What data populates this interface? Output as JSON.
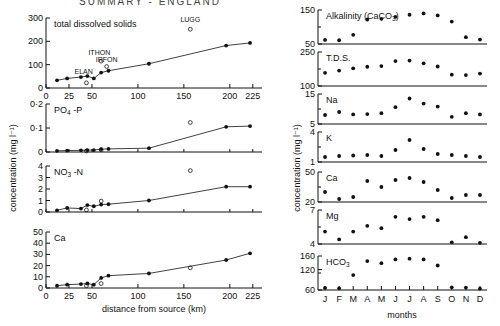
{
  "figure": {
    "title": "SUMMARY  -  ENGLAND",
    "left_axis_label": "concentration (mg l⁻¹)",
    "right_axis_label": "concentration (mg l⁻¹)",
    "left_xlabel": "distance from source (km)",
    "right_xlabel": "months"
  },
  "chart_data": [
    {
      "type": "scatter",
      "title": "total dissolved solids",
      "panel": "left-1",
      "xlabel": "distance from source (km)",
      "ylabel": "concentration (mg l⁻¹)",
      "xlim": [
        0,
        235
      ],
      "ylim": [
        0,
        300
      ],
      "xticks": [
        0,
        25,
        50,
        100,
        150,
        200,
        225
      ],
      "xticklabels": [
        "0",
        "25",
        "50",
        "100",
        "150",
        "200",
        "225"
      ],
      "yticks": [
        0,
        100,
        200,
        300
      ],
      "yticklabels": [
        "0",
        "100",
        "200",
        "300"
      ],
      "grid": false,
      "series": [
        {
          "name": "main stem",
          "marker": "filled-circle",
          "line": true,
          "x": [
            12,
            23,
            38,
            45,
            52,
            60,
            68,
            112,
            196,
            222
          ],
          "y": [
            33,
            41,
            47,
            51,
            41,
            66,
            74,
            104,
            182,
            193
          ]
        },
        {
          "name": "tributaries",
          "marker": "open-circle",
          "line": false,
          "x": [
            44,
            60,
            66,
            157
          ],
          "y": [
            22,
            115,
            92,
            252
          ],
          "labels": [
            "ELAN",
            "ITHON",
            "IRFON",
            "LUGG"
          ]
        }
      ],
      "annotations": [
        {
          "text": "ELAN",
          "x": 41,
          "y": 60
        },
        {
          "text": "ITHON",
          "x": 58,
          "y": 140
        },
        {
          "text": "IRFON",
          "x": 66,
          "y": 110
        },
        {
          "text": "LUGG",
          "x": 157,
          "y": 285
        }
      ]
    },
    {
      "type": "scatter",
      "title": "PO₄ -P",
      "panel": "left-2",
      "xlim": [
        0,
        235
      ],
      "ylim": [
        0,
        0.2
      ],
      "yticks": [
        0,
        0.1,
        0.2
      ],
      "yticklabels": [
        "0",
        "0·1",
        "0·2"
      ],
      "grid": false,
      "series": [
        {
          "name": "main stem",
          "marker": "filled-circle",
          "line": true,
          "x": [
            12,
            23,
            38,
            45,
            52,
            60,
            68,
            112,
            196,
            222
          ],
          "y": [
            0.005,
            0.006,
            0.007,
            0.008,
            0.008,
            0.012,
            0.013,
            0.016,
            0.105,
            0.108
          ]
        },
        {
          "name": "tributaries",
          "marker": "open-circle",
          "line": false,
          "x": [
            44,
            60,
            157
          ],
          "y": [
            0.004,
            0.009,
            0.123
          ]
        }
      ]
    },
    {
      "type": "scatter",
      "title": "NO₃ -N",
      "panel": "left-3",
      "xlim": [
        0,
        235
      ],
      "ylim": [
        0,
        4
      ],
      "yticks": [
        0,
        1,
        2,
        3,
        4
      ],
      "yticklabels": [
        "0",
        "1",
        "2",
        "3",
        "4"
      ],
      "grid": false,
      "series": [
        {
          "name": "main stem",
          "marker": "filled-circle",
          "line": true,
          "x": [
            12,
            23,
            38,
            45,
            52,
            60,
            68,
            112,
            196,
            222
          ],
          "y": [
            0.15,
            0.35,
            0.3,
            0.6,
            0.5,
            0.65,
            0.68,
            1.0,
            2.2,
            2.2
          ]
        },
        {
          "name": "tributaries",
          "marker": "open-circle",
          "line": false,
          "x": [
            44,
            60,
            157
          ],
          "y": [
            0.18,
            0.95,
            3.6
          ]
        }
      ]
    },
    {
      "type": "scatter",
      "title": "Ca",
      "panel": "left-4",
      "xlabel": "distance from source (km)",
      "xlim": [
        0,
        235
      ],
      "ylim": [
        0,
        50
      ],
      "xticks": [
        0,
        25,
        50,
        100,
        150,
        200,
        225
      ],
      "xticklabels": [
        "0",
        "25",
        "50",
        "100",
        "150",
        "200",
        "225"
      ],
      "yticks": [
        0,
        10,
        20,
        30,
        40,
        50
      ],
      "yticklabels": [
        "0",
        "10",
        "20",
        "30",
        "40",
        "50"
      ],
      "grid": false,
      "series": [
        {
          "name": "main stem",
          "marker": "filled-circle",
          "line": true,
          "x": [
            12,
            23,
            38,
            45,
            52,
            60,
            68,
            112,
            196,
            222
          ],
          "y": [
            2,
            3,
            3.5,
            4,
            3,
            9,
            11,
            13,
            25,
            31
          ]
        },
        {
          "name": "tributaries",
          "marker": "open-circle",
          "line": false,
          "x": [
            44,
            60,
            157
          ],
          "y": [
            2,
            4,
            18
          ]
        }
      ]
    },
    {
      "type": "scatter",
      "title": "Alkalinity (CaCO₃)",
      "panel": "right-1",
      "xlabel": "months",
      "xlim": [
        0.5,
        12.5
      ],
      "ylim": [
        50,
        150
      ],
      "yticks": [
        50,
        150
      ],
      "yticklabels": [
        "50",
        "150"
      ],
      "xticklabels": [
        "J",
        "F",
        "M",
        "A",
        "M",
        "J",
        "J",
        "A",
        "S",
        "O",
        "N",
        "D"
      ],
      "grid": false,
      "series": [
        {
          "name": "monthly mean",
          "marker": "filled-circle",
          "line": false,
          "x": [
            1,
            2,
            3,
            4,
            5,
            6,
            7,
            8,
            9,
            10,
            11,
            12
          ],
          "y": [
            62,
            61,
            77,
            122,
            124,
            130,
            136,
            140,
            134,
            116,
            70,
            63
          ]
        }
      ]
    },
    {
      "type": "scatter",
      "title": "T.D.S.",
      "panel": "right-2",
      "xlim": [
        0.5,
        12.5
      ],
      "ylim": [
        100,
        250
      ],
      "yticks": [
        100,
        250
      ],
      "yticklabels": [
        "100",
        "250"
      ],
      "xticklabels": [
        "J",
        "F",
        "M",
        "A",
        "M",
        "J",
        "J",
        "A",
        "S",
        "O",
        "N",
        "D"
      ],
      "grid": false,
      "series": [
        {
          "name": "monthly mean",
          "marker": "filled-circle",
          "line": false,
          "x": [
            1,
            2,
            3,
            4,
            5,
            6,
            7,
            8,
            9,
            10,
            11,
            12
          ],
          "y": [
            158,
            168,
            178,
            185,
            188,
            210,
            212,
            200,
            186,
            150,
            148,
            155
          ]
        }
      ]
    },
    {
      "type": "scatter",
      "title": "Na",
      "panel": "right-3",
      "xlim": [
        0.5,
        12.5
      ],
      "ylim": [
        5,
        15
      ],
      "yticks": [
        5,
        15
      ],
      "yticklabels": [
        "5",
        "15"
      ],
      "xticklabels": [
        "J",
        "F",
        "M",
        "A",
        "M",
        "J",
        "J",
        "A",
        "S",
        "O",
        "N",
        "D"
      ],
      "grid": false,
      "series": [
        {
          "name": "monthly mean",
          "marker": "filled-circle",
          "line": false,
          "x": [
            1,
            2,
            3,
            4,
            5,
            6,
            7,
            8,
            9,
            10,
            11,
            12
          ],
          "y": [
            8.0,
            9.0,
            8.2,
            8.3,
            8.6,
            10.6,
            13.5,
            11.8,
            10.8,
            7.4,
            8.6,
            8.2
          ]
        }
      ]
    },
    {
      "type": "scatter",
      "title": "K",
      "panel": "right-4",
      "xlim": [
        0.5,
        12.5
      ],
      "ylim": [
        1,
        4
      ],
      "yticks": [
        1,
        4
      ],
      "yticklabels": [
        "1",
        "4"
      ],
      "xticklabels": [
        "J",
        "F",
        "M",
        "A",
        "M",
        "J",
        "J",
        "A",
        "S",
        "O",
        "N",
        "D"
      ],
      "grid": false,
      "series": [
        {
          "name": "monthly mean",
          "marker": "filled-circle",
          "line": false,
          "x": [
            1,
            2,
            3,
            4,
            5,
            6,
            7,
            8,
            9,
            10,
            11,
            12
          ],
          "y": [
            1.5,
            1.6,
            1.65,
            1.7,
            1.6,
            2.2,
            3.2,
            2.3,
            1.8,
            1.7,
            1.6,
            1.5
          ]
        }
      ]
    },
    {
      "type": "scatter",
      "title": "Ca",
      "panel": "right-5",
      "xlim": [
        0.5,
        12.5
      ],
      "ylim": [
        20,
        50
      ],
      "yticks": [
        20,
        50
      ],
      "yticklabels": [
        "20",
        "50"
      ],
      "xticklabels": [
        "J",
        "F",
        "M",
        "A",
        "M",
        "J",
        "J",
        "A",
        "S",
        "O",
        "N",
        "D"
      ],
      "grid": false,
      "series": [
        {
          "name": "monthly mean",
          "marker": "filled-circle",
          "line": false,
          "x": [
            1,
            2,
            3,
            4,
            5,
            6,
            7,
            8,
            9,
            10,
            11,
            12
          ],
          "y": [
            30,
            23,
            25,
            41,
            35,
            42,
            44,
            40,
            32,
            24,
            27,
            27
          ]
        }
      ]
    },
    {
      "type": "scatter",
      "title": "Mg",
      "panel": "right-6",
      "xlim": [
        0.5,
        12.5
      ],
      "ylim": [
        4,
        7
      ],
      "yticks": [
        4,
        7
      ],
      "yticklabels": [
        "4",
        "7"
      ],
      "xticklabels": [
        "J",
        "F",
        "M",
        "A",
        "M",
        "J",
        "J",
        "A",
        "S",
        "O",
        "N",
        "D"
      ],
      "grid": false,
      "series": [
        {
          "name": "monthly mean",
          "marker": "filled-circle",
          "line": false,
          "x": [
            1,
            2,
            3,
            4,
            5,
            6,
            7,
            8,
            9,
            10,
            11,
            12
          ],
          "y": [
            5.1,
            4.4,
            5.1,
            5.6,
            5.4,
            6.4,
            6.2,
            6.4,
            6.1,
            4.15,
            4.6,
            4.1
          ]
        }
      ]
    },
    {
      "type": "scatter",
      "title": "HCO₃",
      "panel": "right-7",
      "xlabel": "months",
      "xlim": [
        0.5,
        12.5
      ],
      "ylim": [
        60,
        160
      ],
      "yticks": [
        60,
        120,
        160
      ],
      "yticklabels": [
        "60",
        "120",
        "160"
      ],
      "xticklabels": [
        "J",
        "F",
        "M",
        "A",
        "M",
        "J",
        "J",
        "A",
        "S",
        "O",
        "N",
        "D"
      ],
      "grid": false,
      "series": [
        {
          "name": "monthly mean",
          "marker": "filled-circle",
          "line": false,
          "x": [
            1,
            2,
            3,
            4,
            5,
            6,
            7,
            8,
            9,
            10,
            11,
            12
          ],
          "y": [
            66,
            65,
            104,
            145,
            139,
            150,
            152,
            150,
            132,
            68,
            67,
            64
          ]
        }
      ]
    }
  ]
}
